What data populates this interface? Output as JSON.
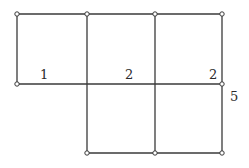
{
  "diagram": {
    "type": "net-of-rectangles",
    "colors": {
      "line": "#3a3a3a",
      "point_fill": "#ffffff",
      "label": "#2a2a2a",
      "background": "#ffffff"
    },
    "points": [
      {
        "id": "p1",
        "x": 17,
        "y": 14
      },
      {
        "id": "p2",
        "x": 87,
        "y": 14
      },
      {
        "id": "p3",
        "x": 155,
        "y": 14
      },
      {
        "id": "p4",
        "x": 222,
        "y": 14
      },
      {
        "id": "p5",
        "x": 17,
        "y": 84
      },
      {
        "id": "p6",
        "x": 222,
        "y": 84
      },
      {
        "id": "p7",
        "x": 87,
        "y": 153
      },
      {
        "id": "p8",
        "x": 155,
        "y": 153
      },
      {
        "id": "p9",
        "x": 222,
        "y": 153
      }
    ],
    "segments": [
      {
        "id": "top-edge",
        "x1": 17,
        "y1": 14,
        "x2": 222,
        "y2": 14
      },
      {
        "id": "middle-edge",
        "x1": 17,
        "y1": 84,
        "x2": 222,
        "y2": 84
      },
      {
        "id": "bottom-edge",
        "x1": 87,
        "y1": 153,
        "x2": 222,
        "y2": 153
      },
      {
        "id": "left-edge",
        "x1": 17,
        "y1": 14,
        "x2": 17,
        "y2": 84
      },
      {
        "id": "inner-edge-1",
        "x1": 87,
        "y1": 14,
        "x2": 87,
        "y2": 153
      },
      {
        "id": "inner-edge-2",
        "x1": 155,
        "y1": 14,
        "x2": 155,
        "y2": 153
      },
      {
        "id": "right-edge",
        "x1": 222,
        "y1": 14,
        "x2": 222,
        "y2": 153
      }
    ],
    "labels": [
      {
        "id": "label-1",
        "text": "1",
        "x": 40,
        "y": 79
      },
      {
        "id": "label-2a",
        "text": "2",
        "x": 125,
        "y": 79
      },
      {
        "id": "label-2b",
        "text": "2",
        "x": 209,
        "y": 79
      },
      {
        "id": "label-5",
        "text": "5",
        "x": 230,
        "y": 101
      }
    ]
  }
}
